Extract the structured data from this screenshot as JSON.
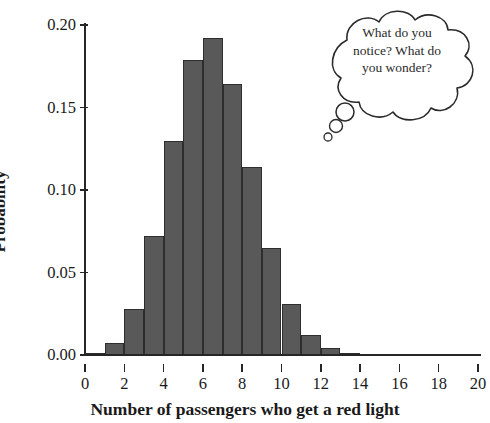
{
  "chart_data": {
    "type": "bar",
    "title": "",
    "subtitle": "",
    "xlabel": "Number of passengers who get a red light",
    "ylabel": "Probability",
    "categories": [
      0,
      1,
      2,
      3,
      4,
      5,
      6,
      7,
      8,
      9,
      10,
      11,
      12,
      13,
      14,
      15,
      16,
      17,
      18,
      19,
      20
    ],
    "values": [
      0.001,
      0.007,
      0.028,
      0.072,
      0.13,
      0.179,
      0.192,
      0.164,
      0.114,
      0.065,
      0.031,
      0.012,
      0.004,
      0.001,
      0.0,
      0.0,
      0.0,
      0.0,
      0.0,
      0.0,
      0.0
    ],
    "xlim": [
      0,
      20
    ],
    "ylim": [
      0.0,
      0.2
    ],
    "x_ticks": [
      0,
      2,
      4,
      6,
      8,
      10,
      12,
      14,
      16,
      18,
      20
    ],
    "x_tick_labels": [
      "0",
      "2",
      "4",
      "6",
      "8",
      "10",
      "12",
      "14",
      "16",
      "18",
      "20"
    ],
    "y_ticks": [
      0.0,
      0.05,
      0.1,
      0.15,
      0.2
    ],
    "y_tick_labels": [
      "0.00",
      "0.05",
      "0.10",
      "0.15",
      "0.20"
    ],
    "grid": false,
    "legend": false,
    "bar_color": "#595959",
    "bar_edge_color": "#2e2e2e",
    "axis_color": "#262626",
    "background_color": "#ffffff"
  },
  "annotation": {
    "thought_bubble": {
      "lines": [
        "What do you",
        "notice? What do",
        "you wonder?"
      ],
      "text": "What do you notice? What do you wonder?",
      "stroke_color": "#2b2b2b"
    }
  }
}
